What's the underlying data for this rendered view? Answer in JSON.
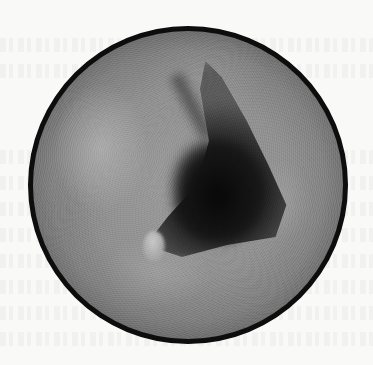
{
  "image": {
    "type": "circular grayscale endoscopic/otoscopic view",
    "description": "Round scope image with thick black border showing a dark triangular cavity in the center, a small bright nodule near the lower left of the cavity, and mottled gray tissue surrounding it",
    "colors": {
      "background": "#f9f9f8",
      "border": "#0d0d0d",
      "tissue": "#8f8f8f",
      "cavity": "#0c0c0c",
      "highlight": "#c9c9c9"
    }
  }
}
